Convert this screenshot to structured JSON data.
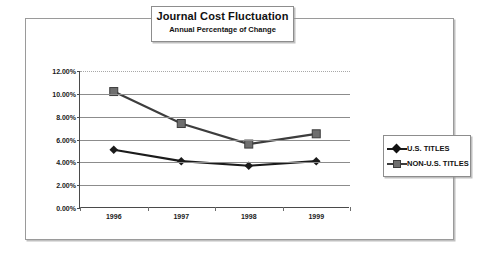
{
  "chart_data": {
    "type": "line",
    "title": "Journal Cost Fluctuation",
    "subtitle": "Annual Percentage of Change",
    "xlabel": "",
    "ylabel": "",
    "categories": [
      "1996",
      "1997",
      "1998",
      "1999"
    ],
    "ylim": [
      0,
      12
    ],
    "ytick_values": [
      0,
      2,
      4,
      6,
      8,
      10,
      12
    ],
    "ytick_labels": [
      "0.00%",
      "2.00%",
      "4.00%",
      "6.00%",
      "8.00%",
      "10.00%",
      "12.00%"
    ],
    "grid": true,
    "legend_position": "right",
    "series": [
      {
        "name": "U.S. TITLES",
        "marker": "diamond",
        "color": "#1b1b1b",
        "values": [
          5.1,
          4.1,
          3.7,
          4.1
        ]
      },
      {
        "name": "NON-U.S. TITLES",
        "marker": "square",
        "color": "#6f6f6f",
        "line_color": "#3d3d3d",
        "values": [
          10.2,
          7.4,
          5.6,
          6.5
        ]
      }
    ]
  },
  "legend": {
    "items": [
      {
        "label": "U.S. TITLES",
        "marker": "diamond-marker-icon"
      },
      {
        "label": "NON-U.S. TITLES",
        "marker": "square-marker-icon"
      }
    ]
  }
}
